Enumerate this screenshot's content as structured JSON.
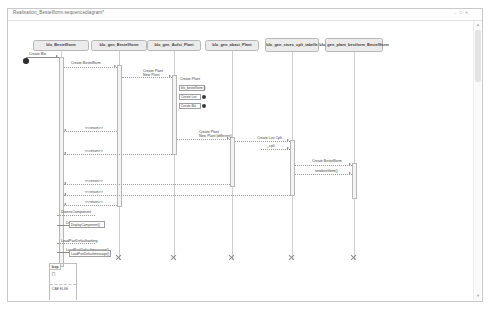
{
  "window": {
    "title": "Realisation_Bestellform.sequencediagram*",
    "buttons": [
      "–",
      "□",
      "✕"
    ]
  },
  "scrollbar": {
    "up_arrow": "▲",
    "down_arrow": "▼"
  },
  "diagram": {
    "type": "uml-sequence-diagram",
    "lifelines": [
      {
        "id": "ll1",
        "label": "blo_Bestellform",
        "x": 52,
        "box_x": 24,
        "box_w": 56,
        "box_y": 31,
        "box_h": 11
      },
      {
        "id": "ll2",
        "label": "blo_gen_Bestellform",
        "x": 110,
        "box_x": 82,
        "box_w": 56,
        "box_y": 31,
        "box_h": 11
      },
      {
        "id": "ll3",
        "label": "blo_gen_Aufst_Plant",
        "x": 165,
        "box_x": 138,
        "box_w": 54,
        "box_h": 11,
        "box_y": 31
      },
      {
        "id": "ll4",
        "label": "blo_gen_abast_Plant",
        "x": 223,
        "box_x": 196,
        "box_w": 54,
        "box_y": 31,
        "box_h": 11
      },
      {
        "id": "ll5",
        "label": "blo_gen_stuec_cplt_tabelle",
        "x": 283,
        "box_x": 256,
        "box_w": 54,
        "box_y": 29,
        "box_h": 14
      },
      {
        "id": "ll6",
        "label": "blo_gen_plant_bestform_Bestellform",
        "x": 345,
        "box_x": 316,
        "box_w": 58,
        "box_y": 29,
        "box_h": 14
      }
    ],
    "start_marker": {
      "x": 14,
      "y": 51
    },
    "messages": [
      {
        "id": "m1",
        "label": "Create Blo",
        "from": 17,
        "to": 50,
        "y": 48,
        "dir": "right",
        "style": "solid",
        "label_x": 20,
        "label_y": 43
      },
      {
        "id": "m2",
        "label": "Create Bestellform",
        "from": 55,
        "to": 108,
        "y": 58,
        "dir": "right",
        "style": "dotted",
        "label_x": 62,
        "label_y": 52
      },
      {
        "id": "m3",
        "label": "Create Plant\nNew Plant",
        "from": 113,
        "to": 163,
        "y": 68,
        "dir": "right",
        "style": "dotted",
        "label_x": 134,
        "label_y": 60
      },
      {
        "id": "m4",
        "label": "Create Plant",
        "from": 168,
        "to": 180,
        "y": 72,
        "dir": "right",
        "style": "none",
        "label_x": 171,
        "label_y": 68
      },
      {
        "id": "m5",
        "label": "Create Plant\nNew Plant (different)",
        "from": 168,
        "to": 221,
        "y": 130,
        "dir": "right",
        "style": "dotted",
        "label_x": 190,
        "label_y": 121
      },
      {
        "id": "m6",
        "label": "Create List Cplt",
        "from": 226,
        "to": 281,
        "y": 132,
        "dir": "right",
        "style": "dotted",
        "label_x": 248,
        "label_y": 127
      },
      {
        "id": "m7",
        "label": "_cplt",
        "from": 252,
        "to": 281,
        "y": 140,
        "dir": "right",
        "style": "dotted",
        "label_x": 258,
        "label_y": 135
      },
      {
        "id": "m8",
        "label": "Create Bestellform",
        "from": 286,
        "to": 343,
        "y": 156,
        "dir": "right",
        "style": "dotted",
        "label_x": 303,
        "label_y": 150
      },
      {
        "id": "m9",
        "label": "newbestform()",
        "from": 286,
        "to": 343,
        "y": 165,
        "dir": "right",
        "style": "dotted",
        "label_x": 306,
        "label_y": 160
      },
      {
        "id": "m10",
        "label": "<<return>>",
        "from": 55,
        "to": 108,
        "y": 122,
        "dir": "left",
        "style": "dotted",
        "label_x": 76,
        "label_y": 117
      },
      {
        "id": "m11",
        "label": "<<return>>",
        "from": 55,
        "to": 163,
        "y": 145,
        "dir": "left",
        "style": "dotted",
        "label_x": 76,
        "label_y": 140
      },
      {
        "id": "m12",
        "label": "<<return>>",
        "from": 55,
        "to": 221,
        "y": 175,
        "dir": "left",
        "style": "dotted",
        "label_x": 76,
        "label_y": 170
      },
      {
        "id": "m13",
        "label": "<<return>>",
        "from": 55,
        "to": 281,
        "y": 186,
        "dir": "left",
        "style": "dotted",
        "label_x": 76,
        "label_y": 181
      },
      {
        "id": "m14",
        "label": "<<return>>",
        "from": 55,
        "to": 108,
        "y": 196,
        "dir": "left",
        "style": "dotted",
        "label_x": 76,
        "label_y": 191
      },
      {
        "id": "m15",
        "label": "DatensComponent",
        "from": 48,
        "to": 86,
        "y": 206,
        "dir": "self",
        "style": "dotted",
        "label_x": 52,
        "label_y": 201
      },
      {
        "id": "m16",
        "label": "DisplayComponent()",
        "from": 48,
        "to": 86,
        "y": 216,
        "dir": "self",
        "style": "solid",
        "label_x": 57,
        "label_y": 212
      },
      {
        "id": "m17",
        "label": "LoadPartDefaultsetting",
        "from": 48,
        "to": 86,
        "y": 234,
        "dir": "self",
        "style": "dotted",
        "label_x": 52,
        "label_y": 230
      },
      {
        "id": "m18",
        "label": "LoadPartDefaultmessage()",
        "from": 48,
        "to": 90,
        "y": 243,
        "dir": "self",
        "style": "solid",
        "label_x": 57,
        "label_y": 239
      }
    ],
    "miniboxes": [
      {
        "id": "b1",
        "label": "blo_bestellform ()",
        "x": 170,
        "y": 76,
        "w": 26,
        "h": 6,
        "dot": false
      },
      {
        "id": "b2",
        "label": "Create List",
        "x": 170,
        "y": 85,
        "w": 22,
        "h": 6,
        "dot": true
      },
      {
        "id": "b3",
        "label": "Create Blo",
        "x": 170,
        "y": 94,
        "w": 22,
        "h": 6,
        "dot": true
      },
      {
        "id": "b4",
        "label": "DisplayComponent()",
        "x": 60,
        "y": 212,
        "w": 36,
        "h": 7,
        "dot": false
      },
      {
        "id": "b5",
        "label": "LoadPartDefaultmessage()",
        "x": 60,
        "y": 241,
        "w": 42,
        "h": 7,
        "dot": false
      }
    ],
    "activations": [
      {
        "id": "a1",
        "x": 50,
        "y": 48,
        "w": 5,
        "h": 210
      },
      {
        "id": "a2",
        "x": 108,
        "y": 56,
        "w": 5,
        "h": 142
      },
      {
        "id": "a3",
        "x": 163,
        "y": 66,
        "w": 5,
        "h": 80
      },
      {
        "id": "a4",
        "x": 221,
        "y": 128,
        "w": 5,
        "h": 50
      },
      {
        "id": "a5",
        "x": 281,
        "y": 131,
        "w": 5,
        "h": 56
      },
      {
        "id": "a6",
        "x": 343,
        "y": 154,
        "w": 5,
        "h": 36
      }
    ],
    "destructions": [
      {
        "id": "x2",
        "x": 106,
        "y": 245
      },
      {
        "id": "x3",
        "x": 161,
        "y": 245
      },
      {
        "id": "x4",
        "x": 219,
        "y": 245
      },
      {
        "id": "x5",
        "x": 279,
        "y": 245
      },
      {
        "id": "x6",
        "x": 341,
        "y": 245
      }
    ],
    "fragment": {
      "operator": "loop",
      "guard": "[*]",
      "alt_label": "CAB ELSE",
      "x": 40,
      "y": 254,
      "w": 28,
      "h": 38
    }
  }
}
